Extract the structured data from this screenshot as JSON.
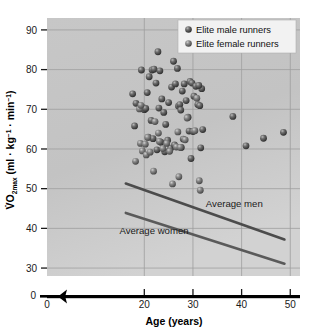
{
  "chart_data": {
    "type": "scatter",
    "title": "",
    "xlabel": "Age (years)",
    "ylabel": "V̇O2max (ml · kg⁻¹ · min⁻¹)",
    "ylabel_parts": {
      "lead": "V̇O",
      "sub": "2max",
      "tail_a": " (ml · kg",
      "sup_a": "−1",
      "tail_b": " · min",
      "sup_b": "−1",
      "tail_c": ")"
    },
    "xlim": [
      0,
      52
    ],
    "ylim": [
      28,
      93
    ],
    "x_ticks": [
      0,
      20,
      30,
      40,
      50
    ],
    "x_tick_labels": [
      "0",
      "20",
      "30",
      "40",
      "50"
    ],
    "y_ticks": [
      30,
      40,
      50,
      60,
      70,
      80,
      90
    ],
    "y_tick_labels": [
      "30",
      "40",
      "50",
      "60",
      "70",
      "80",
      "90"
    ],
    "y_zero_label": "0",
    "grid": true,
    "axis_break_x": true,
    "axis_break_y": true,
    "legend_position": "top-right",
    "legend": [
      {
        "label": "Elite male runners",
        "marker": "sphere",
        "color": "#4a4a4a"
      },
      {
        "label": "Elite female runners",
        "marker": "sphere",
        "color": "#6b6b6b"
      }
    ],
    "annotations": [
      {
        "text": "Average men",
        "x": 38.5,
        "y": 45.5
      },
      {
        "text": "Average women",
        "x": 22.0,
        "y": 38.6
      }
    ],
    "trend_lines": [
      {
        "name": "Average men",
        "x": [
          16.2,
          48.8
        ],
        "y": [
          51.3,
          37.2
        ],
        "color": "#4c4c4c",
        "width": 2.6
      },
      {
        "name": "Average women",
        "x": [
          16.2,
          48.8
        ],
        "y": [
          43.9,
          31.1
        ],
        "color": "#5a5a5a",
        "width": 2.6
      }
    ],
    "series": [
      {
        "name": "Elite male runners",
        "color": "#4a4a4a",
        "points": [
          [
            17.6,
            73.9
          ],
          [
            18.3,
            71.5
          ],
          [
            18.0,
            65.8
          ],
          [
            19.4,
            79.9
          ],
          [
            19.8,
            70.4
          ],
          [
            20.0,
            69.9
          ],
          [
            20.3,
            70.2
          ],
          [
            20.6,
            74.2
          ],
          [
            21.0,
            78.2
          ],
          [
            21.4,
            67.2
          ],
          [
            21.6,
            79.9
          ],
          [
            22.0,
            80.1
          ],
          [
            22.4,
            76.6
          ],
          [
            22.8,
            84.5
          ],
          [
            23.2,
            79.7
          ],
          [
            23.0,
            70.3
          ],
          [
            23.6,
            72.6
          ],
          [
            24.0,
            69.2
          ],
          [
            24.4,
            66.2
          ],
          [
            25.0,
            71.7
          ],
          [
            25.6,
            75.6
          ],
          [
            26.0,
            82.1
          ],
          [
            26.4,
            76.4
          ],
          [
            26.8,
            80.3
          ],
          [
            27.0,
            70.8
          ],
          [
            27.3,
            71.2
          ],
          [
            27.5,
            69.8
          ],
          [
            27.8,
            74.6
          ],
          [
            28.2,
            76.4
          ],
          [
            28.6,
            72.2
          ],
          [
            29.0,
            68.0
          ],
          [
            29.4,
            77.0
          ],
          [
            29.8,
            76.6
          ],
          [
            30.2,
            73.3
          ],
          [
            30.6,
            75.8
          ],
          [
            31.0,
            71.2
          ],
          [
            31.4,
            70.9
          ],
          [
            31.8,
            75.2
          ],
          [
            32.0,
            64.9
          ],
          [
            31.2,
            76.0
          ],
          [
            38.2,
            68.2
          ],
          [
            40.9,
            60.8
          ],
          [
            44.5,
            62.7
          ],
          [
            48.6,
            64.2
          ],
          [
            23.4,
            61.7
          ],
          [
            24.8,
            62.2
          ],
          [
            25.4,
            60.2
          ],
          [
            26.2,
            61.0
          ],
          [
            28.0,
            62.5
          ],
          [
            29.2,
            64.5
          ],
          [
            30.0,
            64.4
          ],
          [
            20.8,
            63.0
          ],
          [
            21.8,
            62.6
          ],
          [
            22.6,
            59.8
          ],
          [
            24.2,
            59.3
          ],
          [
            27.6,
            60.4
          ],
          [
            29.6,
            57.6
          ],
          [
            31.6,
            60.3
          ]
        ]
      },
      {
        "name": "Elite female runners",
        "color": "#6b6b6b",
        "points": [
          [
            18.2,
            56.9
          ],
          [
            19.2,
            61.4
          ],
          [
            19.6,
            59.5
          ],
          [
            20.2,
            61.2
          ],
          [
            20.4,
            58.5
          ],
          [
            20.7,
            62.9
          ],
          [
            21.2,
            59.2
          ],
          [
            21.9,
            54.4
          ],
          [
            23.1,
            61.9
          ],
          [
            23.8,
            60.1
          ],
          [
            25.2,
            59.4
          ],
          [
            25.8,
            51.2
          ],
          [
            26.6,
            60.5
          ],
          [
            27.1,
            53.0
          ],
          [
            27.4,
            60.4
          ],
          [
            28.4,
            62.3
          ],
          [
            31.3,
            52.0
          ],
          [
            31.5,
            49.6
          ],
          [
            22.2,
            66.9
          ],
          [
            24.6,
            61.4
          ],
          [
            19.0,
            70.1
          ],
          [
            19.3,
            71.0
          ],
          [
            22.9,
            64.0
          ],
          [
            26.9,
            64.3
          ],
          [
            30.4,
            64.6
          ],
          [
            28.8,
            67.8
          ],
          [
            30.8,
            72.8
          ]
        ]
      }
    ]
  }
}
